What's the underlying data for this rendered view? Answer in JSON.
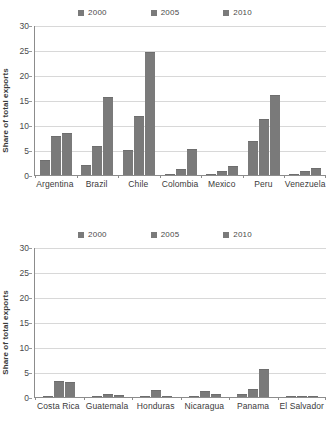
{
  "chart_data": [
    {
      "type": "bar",
      "title": "",
      "xlabel": "",
      "ylabel": "Share of total exports",
      "ylim": [
        0,
        30
      ],
      "yticks": [
        0,
        5,
        10,
        15,
        20,
        25,
        30
      ],
      "grid": true,
      "legend_position": "top",
      "categories": [
        "Argentina",
        "Brazil",
        "Chile",
        "Colombia",
        "Mexico",
        "Peru",
        "Venezuela"
      ],
      "series": [
        {
          "name": "2000",
          "color": "#7a7a7a",
          "values": [
            3.0,
            2.0,
            5.1,
            0.3,
            0.3,
            6.9,
            0.2
          ]
        },
        {
          "name": "2005",
          "color": "#7a7a7a",
          "values": [
            7.8,
            5.8,
            11.8,
            1.3,
            0.8,
            11.3,
            0.9
          ]
        },
        {
          "name": "2010",
          "color": "#7a7a7a",
          "values": [
            8.5,
            15.7,
            24.6,
            5.2,
            1.8,
            16.0,
            1.5
          ]
        }
      ]
    },
    {
      "type": "bar",
      "title": "",
      "xlabel": "",
      "ylabel": "Share of total exports",
      "ylim": [
        0,
        30
      ],
      "yticks": [
        0,
        5,
        10,
        15,
        20,
        25,
        30
      ],
      "grid": true,
      "legend_position": "top",
      "categories": [
        "Costa Rica",
        "Guatemala",
        "Honduras",
        "Nicaragua",
        "Panama",
        "El Salvador"
      ],
      "series": [
        {
          "name": "2000",
          "color": "#7a7a7a",
          "values": [
            0.1,
            0.1,
            0.0,
            0.0,
            0.6,
            0.0
          ]
        },
        {
          "name": "2005",
          "color": "#7a7a7a",
          "values": [
            3.3,
            0.7,
            1.5,
            1.2,
            1.6,
            0.1
          ]
        },
        {
          "name": "2010",
          "color": "#7a7a7a",
          "values": [
            3.0,
            0.5,
            0.0,
            0.7,
            5.6,
            0.1
          ]
        }
      ]
    }
  ]
}
